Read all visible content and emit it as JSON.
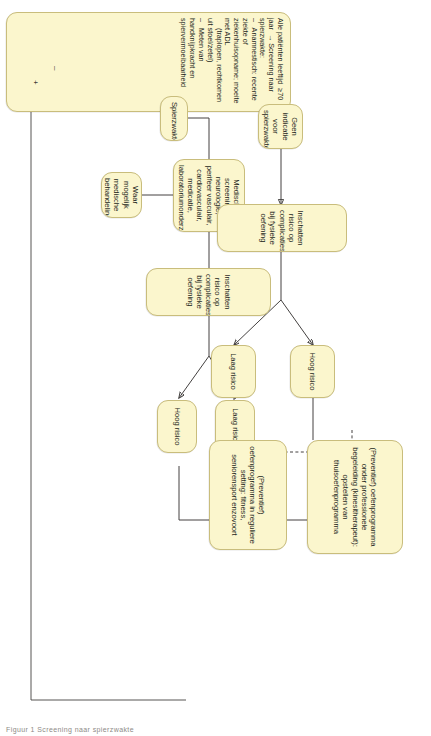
{
  "diagram": {
    "language": "nl",
    "orientation": "rotated-90-clockwise",
    "colors": {
      "node_fill": "#fbf6cd",
      "node_border": "#c9bd7c",
      "connector": "#444140",
      "page_background": "#ffffff",
      "text": "#231f20"
    }
  },
  "nodes": {
    "screening": {
      "id": "screening",
      "label": "Alle patiënten leeftijd  ≥70 jaar  → Screening naar spierzwakte:\n–   Anamnestisch: recente ziekte of ziekenhuisopname; moeite met ADL\n     (traplopen, rechtkomen uit stoel/zetel)\n–   Meten van handknijpkracht en spiervermoeibaarheid",
      "lines": [
        "Alle patiënten leeftijd   ≥70 jaar   →  Screening naar spierzwakte:",
        "–   Anamnestisch: recente ziekte of ziekenhuisopname; moeite met ADL",
        "      (traplopen, rechtkomen uit stoel/zetel)",
        "–   Meten van handknijpkracht en spiervermoeibaarheid"
      ]
    },
    "geen_indicatie": {
      "id": "geen_indicatie",
      "label": "Geen indicatie voor spierzwakte"
    },
    "spierzwakte": {
      "id": "spierzwakte",
      "label": "Spierzwakte"
    },
    "medische_screening": {
      "id": "medische_screening",
      "label": "Medische screening: neurologie, perifeer vasculair, cardiovasculair, medicatie, laboratoriumonderzoek"
    },
    "medische_behandeling": {
      "id": "medische_behandeling",
      "label": "Waar mogelijk medische behandeling"
    },
    "risico_top": {
      "id": "risico_top",
      "label": "Inschatten risico op complicaties bij fysieke oefening"
    },
    "risico_bottom": {
      "id": "risico_bottom",
      "label": "Inschatten risico op complicaties bij fysieke oefening"
    },
    "hoog_risico_top": {
      "id": "hoog_risico_top",
      "label": "Hoog risico"
    },
    "laag_risico_top": {
      "id": "laag_risico_top",
      "label": "Laag risico"
    },
    "laag_risico_bottom": {
      "id": "laag_risico_bottom",
      "label": "Laag risico"
    },
    "hoog_risico_bottom": {
      "id": "hoog_risico_bottom",
      "label": "Hoog risico"
    },
    "prog_professioneel": {
      "id": "prog_professioneel",
      "label": "(Preventief) oefenprogramma onder professionele begeleiding (kinesitherapeut): opstellen van thuisoefenprogramma"
    },
    "prog_regulier": {
      "id": "prog_regulier",
      "label": "(Preventief) oefenprogramma in reguliere setting: fitness, seniorensport enzovoort"
    }
  },
  "markers": {
    "minus": "–",
    "plus": "+"
  },
  "caption": {
    "text": "Figuur 1    Screening naar spierzwakte"
  }
}
